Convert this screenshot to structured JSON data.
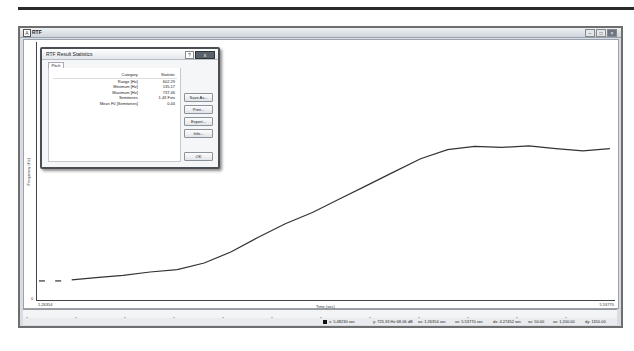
{
  "app": {
    "title": "RTF",
    "controls": [
      "minimize",
      "maximize",
      "close"
    ]
  },
  "dialog": {
    "title": "RTF Result Statistics",
    "help_label": "?",
    "close_label": "x",
    "tab_label": "Pitch",
    "table": {
      "headers": [
        "Category",
        "Statistic"
      ],
      "rows": [
        {
          "category": "Range [Hz]",
          "value": "602.29"
        },
        {
          "category": "Minimum [Hz]",
          "value": "135.17"
        },
        {
          "category": "Maximum [Hz]",
          "value": "737.46"
        },
        {
          "category": "Semitones",
          "value": "1.43 Fsts"
        },
        {
          "category": "Mean F0 [Semitones]",
          "value": "0.44"
        }
      ]
    },
    "buttons": {
      "save_as": "Save As...",
      "print": "Print...",
      "export": "Export...",
      "info": "Info...",
      "ok": "OK"
    }
  },
  "plot": {
    "ylabel": "Frequency (Hz)",
    "xlabel": "Time (sec)",
    "y_min_label": "0",
    "x_start_label": "1.26354",
    "x_end_label": "5.53770"
  },
  "status": {
    "cursor_x": "x: 5.48230 sec",
    "cursor_y": "y: 725.33 Hz 68.06 dB",
    "start": "xx: 1.26354 sec",
    "end": "xx: 5.53770 sec",
    "dx": "dx: 4.27452 sec",
    "y_low": "xx: 50.00",
    "y_high": "xx: 1,200.00",
    "dy": "dy: 1150.00"
  },
  "chart_data": {
    "type": "line",
    "title": "",
    "xlabel": "Time (sec)",
    "ylabel": "Frequency (Hz)",
    "xlim": [
      1.26354,
      5.5377
    ],
    "ylim": [
      50,
      1200
    ],
    "series": [
      {
        "name": "Pitch",
        "x": [
          1.3,
          1.42,
          1.52,
          1.7,
          1.9,
          2.1,
          2.3,
          2.5,
          2.7,
          2.9,
          3.1,
          3.3,
          3.5,
          3.7,
          3.9,
          4.1,
          4.3,
          4.5,
          4.7,
          4.9,
          5.1,
          5.3,
          5.5
        ],
        "y": [
          135,
          135,
          140,
          150,
          160,
          175,
          185,
          215,
          265,
          330,
          390,
          440,
          500,
          560,
          620,
          680,
          720,
          735,
          730,
          737,
          725,
          715,
          725
        ]
      }
    ],
    "grid": false,
    "legend": "none"
  }
}
